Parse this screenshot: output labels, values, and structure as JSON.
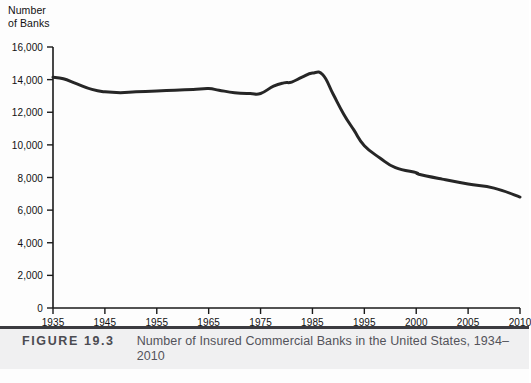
{
  "figure": {
    "number_label": "FIGURE 19.3",
    "caption": "Number of Insured Commercial Banks in the United States, 1934–2010",
    "rule_color": "#3b3b40",
    "band_color": "#f0f0f1",
    "caption_text_color": "#53535a"
  },
  "chart_data": {
    "type": "line",
    "title": "Number of Insured Commercial Banks in the United States, 1934–2010",
    "xlabel": "",
    "ylabel": "Number\nof Banks",
    "ylabel_line1": "Number",
    "ylabel_line2": "of Banks",
    "line_color": "#262626",
    "line_width": 3,
    "grid": false,
    "legend": false,
    "ylim": [
      0,
      16000
    ],
    "ytick_values": [
      0,
      2000,
      4000,
      6000,
      8000,
      10000,
      12000,
      14000,
      16000
    ],
    "ytick_labels": [
      "0",
      "2,000",
      "4,000",
      "6,000",
      "8,000",
      "10,000",
      "12,000",
      "14,000",
      "16,000"
    ],
    "xtick_labels": [
      "1935",
      "1945",
      "1955",
      "1965",
      "1975",
      "1985",
      "1995",
      "2000",
      "2005",
      "2010"
    ],
    "xtick_positions": [
      0,
      1,
      2,
      3,
      4,
      5,
      6,
      7,
      8,
      9
    ],
    "x_axis_note": "Tick marks are evenly spaced; intervals are 10 years through 1995, then 5 years.",
    "series": [
      {
        "name": "Number of Insured Commercial Banks",
        "points": [
          {
            "x": 0.0,
            "year": 1935,
            "value": 14150
          },
          {
            "x": 0.2,
            "year": 1937,
            "value": 14050
          },
          {
            "x": 0.45,
            "year": 1939,
            "value": 13750
          },
          {
            "x": 0.75,
            "year": 1942,
            "value": 13400
          },
          {
            "x": 1.0,
            "year": 1945,
            "value": 13250
          },
          {
            "x": 1.3,
            "year": 1948,
            "value": 13200
          },
          {
            "x": 1.6,
            "year": 1951,
            "value": 13250
          },
          {
            "x": 2.0,
            "year": 1955,
            "value": 13300
          },
          {
            "x": 2.35,
            "year": 1958,
            "value": 13350
          },
          {
            "x": 2.7,
            "year": 1962,
            "value": 13400
          },
          {
            "x": 3.0,
            "year": 1965,
            "value": 13450
          },
          {
            "x": 3.2,
            "year": 1967,
            "value": 13350
          },
          {
            "x": 3.5,
            "year": 1970,
            "value": 13200
          },
          {
            "x": 3.8,
            "year": 1973,
            "value": 13150
          },
          {
            "x": 4.0,
            "year": 1975,
            "value": 13150
          },
          {
            "x": 4.25,
            "year": 1977,
            "value": 13600
          },
          {
            "x": 4.45,
            "year": 1979,
            "value": 13800
          },
          {
            "x": 4.6,
            "year": 1981,
            "value": 13850
          },
          {
            "x": 4.8,
            "year": 1983,
            "value": 14150
          },
          {
            "x": 5.0,
            "year": 1985,
            "value": 14400
          },
          {
            "x": 5.2,
            "year": 1987,
            "value": 14300
          },
          {
            "x": 5.4,
            "year": 1989,
            "value": 13100
          },
          {
            "x": 5.6,
            "year": 1991,
            "value": 11900
          },
          {
            "x": 5.8,
            "year": 1993,
            "value": 10900
          },
          {
            "x": 6.0,
            "year": 1995,
            "value": 9950
          },
          {
            "x": 6.3,
            "year": 1997,
            "value": 9200
          },
          {
            "x": 6.6,
            "year": 1999,
            "value": 8600
          },
          {
            "x": 7.0,
            "year": 2000,
            "value": 8300
          },
          {
            "x": 7.05,
            "year": 2001,
            "value": 8200
          },
          {
            "x": 7.5,
            "year": 2003,
            "value": 7900
          },
          {
            "x": 8.0,
            "year": 2005,
            "value": 7600
          },
          {
            "x": 8.5,
            "year": 2007,
            "value": 7350
          },
          {
            "x": 9.0,
            "year": 2010,
            "value": 6800
          }
        ]
      }
    ]
  }
}
